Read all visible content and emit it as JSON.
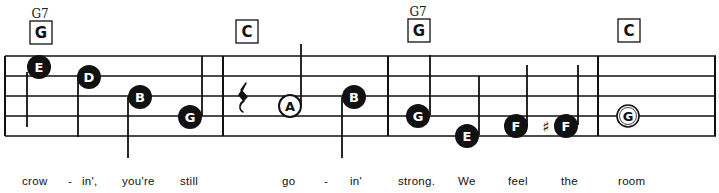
{
  "chords": [
    {
      "name": "G7",
      "box": "G",
      "measure": 1
    },
    {
      "name": "",
      "box": "C",
      "measure": 2
    },
    {
      "name": "G7",
      "box": "G",
      "measure": 3
    },
    {
      "name": "",
      "box": "C",
      "measure": 4
    }
  ],
  "notes": [
    {
      "letter": "E",
      "style": "filled",
      "stem": "down",
      "measure": 1
    },
    {
      "letter": "D",
      "style": "filled",
      "stem": "down",
      "measure": 1
    },
    {
      "letter": "B",
      "style": "filled",
      "stem": "down",
      "measure": 1
    },
    {
      "letter": "G",
      "style": "filled",
      "stem": "up",
      "measure": 1
    },
    {
      "letter": "rest",
      "style": "quarter-rest",
      "measure": 2
    },
    {
      "letter": "A",
      "style": "open",
      "stem": "up",
      "measure": 2
    },
    {
      "letter": "B",
      "style": "filled",
      "stem": "down",
      "measure": 2
    },
    {
      "letter": "G",
      "style": "filled",
      "stem": "up",
      "measure": 3
    },
    {
      "letter": "E",
      "style": "filled",
      "stem": "up",
      "measure": 3
    },
    {
      "letter": "F",
      "style": "filled",
      "stem": "up",
      "measure": 3
    },
    {
      "letter": "F",
      "style": "filled",
      "stem": "up",
      "accidental": "♯",
      "measure": 3
    },
    {
      "letter": "G",
      "style": "open-whole",
      "measure": 4
    }
  ],
  "lyrics": [
    "crow",
    "-",
    "in',",
    "you're",
    "still",
    "go",
    "-",
    "in'",
    "strong.",
    "We",
    "feel",
    "the",
    "room"
  ],
  "colors": {
    "ink": "#111111",
    "paper": "#ffffff"
  }
}
